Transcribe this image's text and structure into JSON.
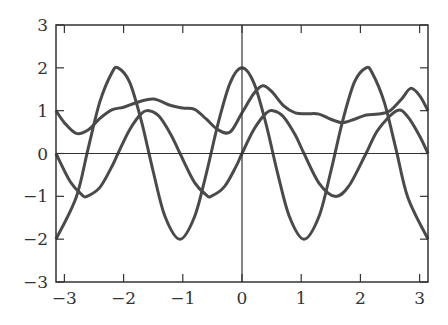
{
  "chart_data": {
    "type": "line",
    "title": "",
    "xlabel": "",
    "ylabel": "",
    "xlim": [
      -3.14159,
      3.14159
    ],
    "ylim": [
      -3,
      3
    ],
    "grid": false,
    "legend": null,
    "x_ticks": [
      -3,
      -2,
      -1,
      0,
      1,
      2,
      3
    ],
    "x_tick_labels": [
      "−3",
      "−2",
      "−1",
      "0",
      "1",
      "2",
      "3"
    ],
    "y_ticks": [
      -3,
      -2,
      -1,
      0,
      1,
      2,
      3
    ],
    "y_tick_labels": [
      "−3",
      "−2",
      "−1",
      "0",
      "1",
      "2",
      "3"
    ],
    "axes_lines": {
      "x_zero": true,
      "y_zero": true
    },
    "line_color": "#4a4a4a",
    "series": [
      {
        "name": "2cos(3x)",
        "x": [
          -3.1416,
          -2.8,
          -2.6,
          -2.4,
          -2.2,
          -2.0944,
          -1.9,
          -1.7,
          -1.5,
          -1.3,
          -1.0472,
          -0.8,
          -0.6,
          -0.4,
          -0.2,
          0,
          0.2,
          0.4,
          0.6,
          0.8,
          1.0472,
          1.3,
          1.5,
          1.7,
          1.9,
          2.0944,
          2.2,
          2.4,
          2.6,
          2.8,
          3.1416
        ],
        "y": [
          -2,
          -1.02,
          0.11,
          1.21,
          1.88,
          2,
          1.67,
          0.76,
          -0.42,
          -1.47,
          -2,
          -1.47,
          -0.45,
          0.72,
          1.65,
          2,
          1.65,
          0.72,
          -0.45,
          -1.47,
          -2,
          -1.47,
          -0.42,
          0.76,
          1.67,
          2,
          1.88,
          1.21,
          0.11,
          -1.02,
          -2
        ]
      },
      {
        "name": "sin(3x)",
        "x": [
          -3.1416,
          -2.9,
          -2.7,
          -2.618,
          -2.4,
          -2.2,
          -2.0944,
          -1.9,
          -1.7,
          -1.5708,
          -1.4,
          -1.2,
          -1.0472,
          -0.8,
          -0.6,
          -0.5236,
          -0.3,
          -0.1,
          0,
          0.2,
          0.4,
          0.5236,
          0.7,
          0.9,
          1.0472,
          1.3,
          1.5708,
          1.8,
          2.0944,
          2.3,
          2.618,
          2.8,
          3.0,
          3.1416
        ],
        "y": [
          0,
          -0.66,
          -0.97,
          -1,
          -0.79,
          -0.31,
          0,
          0.55,
          0.93,
          1,
          0.87,
          0.44,
          0,
          -0.68,
          -0.97,
          -1,
          -0.78,
          -0.3,
          0,
          0.56,
          0.93,
          1,
          0.86,
          0.43,
          0,
          -0.69,
          -1,
          -0.77,
          0,
          0.56,
          1,
          0.86,
          0.41,
          0
        ]
      },
      {
        "name": "curve-3",
        "x": [
          -3.1416,
          -3.0,
          -2.8,
          -2.6,
          -2.4,
          -2.2,
          -2.0,
          -1.8,
          -1.5,
          -1.2,
          -1.0,
          -0.8,
          -0.6,
          -0.4,
          -0.2,
          0,
          0.2,
          0.35,
          0.5,
          0.7,
          0.9,
          1.1,
          1.3,
          1.5,
          1.7,
          1.9,
          2.1,
          2.3,
          2.5,
          2.7,
          2.85,
          3.0,
          3.1416
        ],
        "y": [
          1,
          0.72,
          0.47,
          0.55,
          0.82,
          1.02,
          1.08,
          1.18,
          1.27,
          1.12,
          1.06,
          1.03,
          0.8,
          0.55,
          0.5,
          0.95,
          1.4,
          1.58,
          1.45,
          1.12,
          0.95,
          0.93,
          0.92,
          0.8,
          0.72,
          0.8,
          0.9,
          0.92,
          1.0,
          1.28,
          1.52,
          1.35,
          1.0
        ]
      }
    ]
  }
}
